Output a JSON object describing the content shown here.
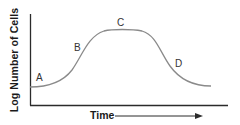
{
  "diagram": {
    "y_axis_label": "Log Number of Cells",
    "x_axis_label": "Time",
    "x_axis_arrow": "right-arrow",
    "phases": [
      {
        "label": "A"
      },
      {
        "label": "B"
      },
      {
        "label": "C"
      },
      {
        "label": "D"
      }
    ],
    "colors": {
      "axis": "#2b2b2b",
      "curve": "#8a8a8a",
      "text": "#1a1a1a"
    }
  }
}
